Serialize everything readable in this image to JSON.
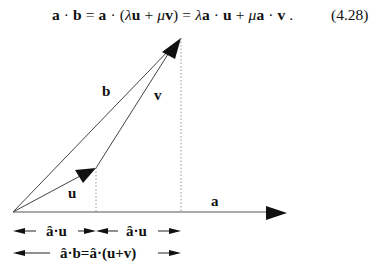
{
  "equation": {
    "parts": {
      "p1": "a",
      "p2": " · ",
      "p3": "b",
      "p4": " = ",
      "p5": "a",
      "p6": " · (",
      "p7": "λ",
      "p8": "u",
      "p9": " + ",
      "p10": "μ",
      "p11": "v",
      "p12": ") = ",
      "p13": "λ",
      "p14": "a",
      "p15": " · ",
      "p16": "u",
      "p17": " + ",
      "p18": "μ",
      "p19": "a",
      "p20": " · ",
      "p21": "v",
      "p22": " ."
    },
    "number": "(4.28)"
  },
  "diagram": {
    "vectors": {
      "a": "a",
      "b": "b",
      "u": "u",
      "v": "v"
    },
    "measures": {
      "proj_u_1": "â·u",
      "proj_u_2": "â·u",
      "proj_b": "â·b=â·(u+v)"
    },
    "colors": {
      "stroke": "#111111",
      "dotted": "#888888"
    }
  }
}
